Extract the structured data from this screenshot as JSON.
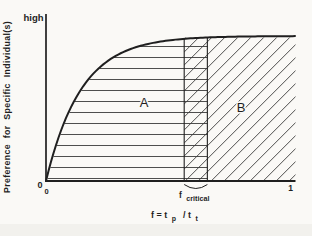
{
  "figure": {
    "background": "#faf9f6",
    "ink_color": "#1f1f1f",
    "hatch_color": "#3a3a3a",
    "artifact_color": "#e9e7e2"
  },
  "labels": {
    "y_max": "high",
    "y_axis_title": "Preference for Specific Individual(s)",
    "y_origin": "0",
    "x_origin": "0",
    "x_max": "1",
    "region_a": "A",
    "region_b": "B",
    "critical_base": "f",
    "critical_sub": "critical",
    "x_title_pre": "f = t",
    "x_title_sub1": "p",
    "x_title_mid": " / t",
    "x_title_sub2": "t"
  },
  "chart_data": {
    "type": "area",
    "title": "",
    "xlabel": "f = t_p / t_t",
    "ylabel": "Preference for Specific Individual(s)",
    "x_range": [
      0,
      1
    ],
    "x_ticks": [
      {
        "value": 0,
        "label": "0"
      },
      {
        "value": 1,
        "label": "1"
      }
    ],
    "y_range_labels": [
      "0",
      "high"
    ],
    "grid": false,
    "legend": "none",
    "curve": {
      "shape": "saturating growth from origin, asymptoting toward 'high'",
      "model": "y_frac = 1 - exp(-x_frac / tau_frac)",
      "tau_frac": 0.141,
      "sample_points": [
        [
          0,
          0
        ],
        [
          0.1,
          0.51
        ],
        [
          0.2,
          0.76
        ],
        [
          0.3,
          0.88
        ],
        [
          0.4,
          0.94
        ],
        [
          0.55,
          0.98
        ],
        [
          0.7,
          0.993
        ],
        [
          1.0,
          0.999
        ]
      ]
    },
    "f_critical_band": {
      "label": "f_critical",
      "x_from": 0.555,
      "x_to": 0.648,
      "hatch": "cross (horizontal + diagonal overlap)"
    },
    "regions": [
      {
        "name": "A",
        "description": "area under the curve left of the f_critical band",
        "hatch": "horizontal",
        "x_from": 0.0,
        "x_to": 0.648
      },
      {
        "name": "B",
        "description": "area under the plateau right of the f_critical band",
        "hatch": "diagonal",
        "x_from": 0.555,
        "x_to": 1.0
      }
    ]
  }
}
